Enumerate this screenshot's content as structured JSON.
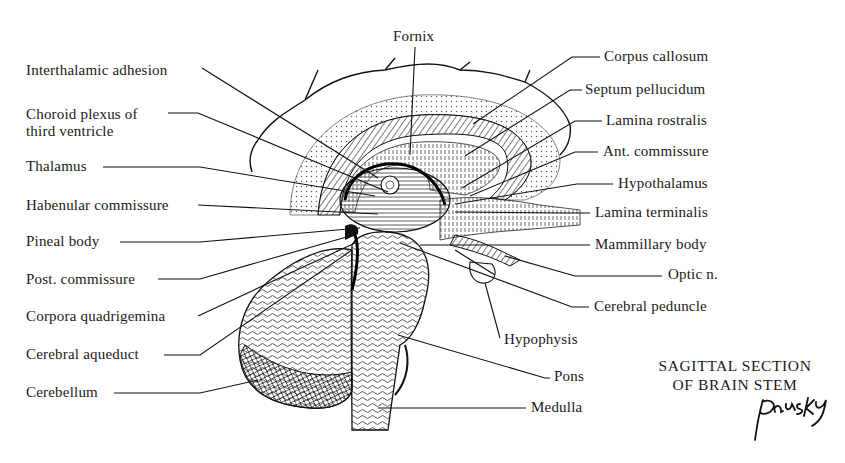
{
  "figure": {
    "title_line1": "SAGITTAL SECTION",
    "title_line2": "OF BRAIN STEM",
    "signature": "Pansky"
  },
  "labels": {
    "left": [
      {
        "id": "interthalamic-adhesion",
        "text": "Interthalamic adhesion",
        "x": 26,
        "y": 62,
        "line": [
          [
            202,
            68
          ],
          [
            378,
            178
          ]
        ]
      },
      {
        "id": "choroid-plexus",
        "text": "Choroid plexus of",
        "text2": "third ventricle",
        "x": 26,
        "y": 106,
        "line": [
          [
            168,
            113
          ],
          [
            198,
            113
          ],
          [
            388,
            192
          ]
        ]
      },
      {
        "id": "thalamus",
        "text": "Thalamus",
        "x": 26,
        "y": 158,
        "line": [
          [
            103,
            167
          ],
          [
            200,
            167
          ],
          [
            375,
            196
          ]
        ]
      },
      {
        "id": "habenular-commissure",
        "text": "Habenular commissure",
        "x": 26,
        "y": 197,
        "line": [
          [
            198,
            205
          ],
          [
            378,
            214
          ]
        ]
      },
      {
        "id": "pineal-body",
        "text": "Pineal body",
        "x": 26,
        "y": 233,
        "line": [
          [
            120,
            242
          ],
          [
            200,
            242
          ],
          [
            360,
            228
          ]
        ]
      },
      {
        "id": "post-commissure",
        "text": "Post. commissure",
        "x": 26,
        "y": 271,
        "line": [
          [
            158,
            279
          ],
          [
            200,
            279
          ],
          [
            350,
            236
          ]
        ]
      },
      {
        "id": "corpora-quadrigemina",
        "text": "Corpora quadrigemina",
        "x": 26,
        "y": 308,
        "line": [
          [
            198,
            316
          ],
          [
            355,
            243
          ]
        ]
      },
      {
        "id": "cerebral-aqueduct",
        "text": "Cerebral aqueduct",
        "x": 26,
        "y": 346,
        "line": [
          [
            164,
            355
          ],
          [
            200,
            355
          ],
          [
            352,
            250
          ]
        ]
      },
      {
        "id": "cerebellum",
        "text": "Cerebellum",
        "x": 26,
        "y": 384,
        "line": [
          [
            114,
            393
          ],
          [
            200,
            393
          ],
          [
            258,
            380
          ]
        ]
      }
    ],
    "top": [
      {
        "id": "fornix",
        "text": "Fornix",
        "x": 393,
        "y": 28,
        "line": [
          [
            415,
            47
          ],
          [
            410,
            155
          ]
        ]
      }
    ],
    "right": [
      {
        "id": "corpus-callosum",
        "text": "Corpus callosum",
        "x": 604,
        "y": 48,
        "line": [
          [
            600,
            57
          ],
          [
            572,
            57
          ],
          [
            473,
            124
          ]
        ]
      },
      {
        "id": "septum-pellucidum",
        "text": "Septum pellucidum",
        "x": 585,
        "y": 81,
        "line": [
          [
            582,
            90
          ],
          [
            570,
            90
          ],
          [
            465,
            156
          ]
        ]
      },
      {
        "id": "lamina-rostralis",
        "text": "Lamina rostralis",
        "x": 606,
        "y": 112,
        "line": [
          [
            602,
            121
          ],
          [
            575,
            121
          ],
          [
            462,
            188
          ]
        ]
      },
      {
        "id": "ant-commissure",
        "text": "Ant. commissure",
        "x": 603,
        "y": 143,
        "line": [
          [
            598,
            152
          ],
          [
            575,
            152
          ],
          [
            470,
            196
          ]
        ]
      },
      {
        "id": "hypothalamus",
        "text": "Hypothalamus",
        "x": 618,
        "y": 175,
        "line": [
          [
            613,
            184
          ],
          [
            577,
            184
          ],
          [
            455,
            204
          ]
        ]
      },
      {
        "id": "lamina-terminalis",
        "text": "Lamina terminalis",
        "x": 595,
        "y": 204,
        "line": [
          [
            590,
            213
          ],
          [
            570,
            213
          ],
          [
            455,
            212
          ]
        ]
      },
      {
        "id": "mammillary-body",
        "text": "Mammillary body",
        "x": 595,
        "y": 236,
        "line": [
          [
            590,
            245
          ],
          [
            420,
            245
          ]
        ]
      },
      {
        "id": "optic-n",
        "text": "Optic n.",
        "x": 668,
        "y": 266,
        "line": [
          [
            662,
            276
          ],
          [
            575,
            276
          ],
          [
            505,
            256
          ]
        ]
      },
      {
        "id": "cerebral-peduncle",
        "text": "Cerebral peduncle",
        "x": 594,
        "y": 298,
        "line": [
          [
            589,
            307
          ],
          [
            572,
            307
          ],
          [
            400,
            243
          ]
        ]
      },
      {
        "id": "hypophysis",
        "text": "Hypophysis",
        "x": 504,
        "y": 331,
        "line": [
          [
            500,
            338
          ],
          [
            485,
            283
          ]
        ]
      },
      {
        "id": "pons",
        "text": "Pons",
        "x": 554,
        "y": 368,
        "line": [
          [
            550,
            378
          ],
          [
            545,
            378
          ],
          [
            398,
            335
          ]
        ]
      },
      {
        "id": "medulla",
        "text": "Medulla",
        "x": 531,
        "y": 399,
        "line": [
          [
            526,
            408
          ],
          [
            378,
            408
          ]
        ]
      }
    ]
  }
}
